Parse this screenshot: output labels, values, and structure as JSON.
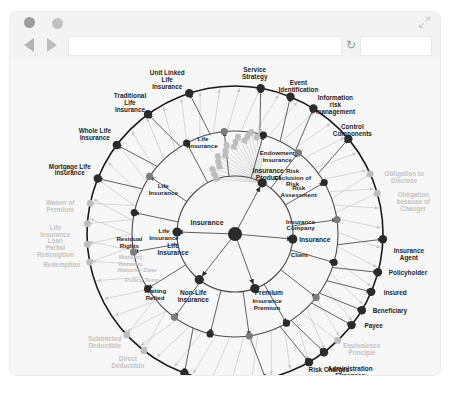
{
  "window": {
    "dots": [
      "window-dot-dark",
      "window-dot-light"
    ],
    "expand_icon": "expand-icon"
  },
  "toolbar": {
    "back_icon": "back-arrow-icon",
    "forward_icon": "forward-arrow-icon",
    "url_value": "",
    "url_placeholder": "",
    "reload_icon": "reload-icon",
    "search_value": "",
    "search_placeholder": ""
  },
  "diagram": {
    "type": "radial-network-graph",
    "colors": {
      "dark_node": "#2b2b2b",
      "mid_node": "#7d7d7d",
      "light_node": "#bdbdbd",
      "ring": "#1a1a1a",
      "inner_ring": "#4a4a4a",
      "edge_dark": "#3a3a3a",
      "edge_light": "#c9c9c9",
      "label_dark": "#1f1f1f",
      "label_faded": "#c4c4c4",
      "canvas": "#f7f7f7"
    },
    "core": {
      "center_label": "Insurance",
      "spokes": [
        "Insurance Product",
        "Life Insurance",
        "Non-Life Insurance",
        "Premium",
        "Insurance"
      ]
    },
    "outer_ring_labels": [
      "Unit Linked Life Insurance",
      "Traditional Life Insurance",
      "Whole Life Insurance",
      "Mortgage Life Insurance",
      "Waiver of Premium",
      "Life Insurance Loan",
      "Partial Redemption",
      "Redemption",
      "Subtracted Deductible",
      "Direct Deductible",
      "Property Value",
      "Saving component",
      "Risk Charges",
      "Administration Expenses",
      "Equivalence Principle",
      "Payee",
      "Beneficiary",
      "Insured",
      "Policyholder",
      "Insurance Agent",
      "Obligation because of Changer",
      "Obligation to Disclose",
      "Control Components",
      "Information risk management",
      "Event Identification",
      "Service Strategy"
    ],
    "inner_labels": [
      "Life Insurance",
      "Endowment Insurance",
      "Life Insurance",
      "Life Insurance",
      "Life Insurance",
      "Residual Rights",
      "Maturity Benefits",
      "Maturity Date",
      "Policy Term",
      "Waiting Period",
      "Insurance Product",
      "Insurance",
      "Non-Life Insurance",
      "Premium",
      "Insurance Premium",
      "Insurance",
      "Client",
      "Insurance Company",
      "Risk Assessment",
      "Risk Exclusion of Risk"
    ],
    "faded_labels": [
      "Waiver of Premium",
      "Life Insurance Loan",
      "Partial Redemption",
      "Redemption",
      "Maturity Benefits",
      "Maturity Date",
      "Policy Term",
      "Waiting Period",
      "Subtracted Deductible",
      "Direct Deductible",
      "Equivalence Principle",
      "Obligation to Disclose",
      "Obligation because of Changer"
    ]
  }
}
